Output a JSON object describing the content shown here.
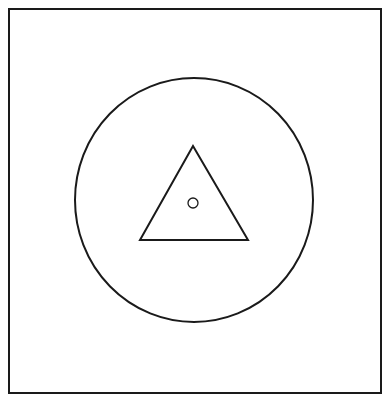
{
  "diagram": {
    "background": "#ffffff",
    "stroke_color": "#1a1a1a",
    "shapes": {
      "frame": {
        "type": "rect",
        "x": 9,
        "y": 9,
        "width": 372,
        "height": 384,
        "stroke_width": 2
      },
      "outer_circle": {
        "type": "ellipse",
        "cx": 194,
        "cy": 200,
        "rx": 119,
        "ry": 122,
        "stroke_width": 2
      },
      "triangle": {
        "type": "polygon",
        "points": [
          [
            193,
            146
          ],
          [
            140,
            240
          ],
          [
            248,
            240
          ]
        ],
        "stroke_width": 2
      },
      "inner_dot": {
        "type": "circle",
        "cx": 193,
        "cy": 203,
        "r": 5,
        "stroke_width": 1.3
      }
    }
  }
}
